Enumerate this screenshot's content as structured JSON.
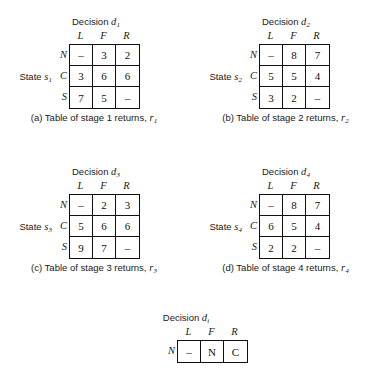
{
  "figure": {
    "kind": "decision-return-tables",
    "background_color": "#ffffff",
    "ink_color": "#111111"
  },
  "tables": [
    {
      "id": "a",
      "decision_prefix": "Decision ",
      "decision_symbol": "d",
      "decision_subscript": "1",
      "state_prefix": "State ",
      "state_symbol": "s",
      "state_subscript": "1",
      "col_headers": [
        "L",
        "F",
        "R"
      ],
      "row_headers": [
        "N",
        "C",
        "S"
      ],
      "rows": [
        [
          "–",
          "3",
          "2"
        ],
        [
          "3",
          "6",
          "6"
        ],
        [
          "7",
          "5",
          "–"
        ]
      ],
      "caption_text": "(a) Table of stage 1 returns, ",
      "caption_symbol": "r",
      "caption_subscript": "1"
    },
    {
      "id": "b",
      "decision_prefix": "Decision ",
      "decision_symbol": "d",
      "decision_subscript": "2",
      "state_prefix": "State ",
      "state_symbol": "s",
      "state_subscript": "2",
      "col_headers": [
        "L",
        "F",
        "R"
      ],
      "row_headers": [
        "N",
        "C",
        "S"
      ],
      "rows": [
        [
          "–",
          "8",
          "7"
        ],
        [
          "5",
          "5",
          "4"
        ],
        [
          "3",
          "2",
          "–"
        ]
      ],
      "caption_text": "(b) Table of stage 2 returns, ",
      "caption_symbol": "r",
      "caption_subscript": "2"
    },
    {
      "id": "c",
      "decision_prefix": "Decision ",
      "decision_symbol": "d",
      "decision_subscript": "3",
      "state_prefix": "State ",
      "state_symbol": "s",
      "state_subscript": "3",
      "col_headers": [
        "L",
        "F",
        "R"
      ],
      "row_headers": [
        "N",
        "C",
        "S"
      ],
      "rows": [
        [
          "–",
          "2",
          "3"
        ],
        [
          "5",
          "6",
          "6"
        ],
        [
          "9",
          "7",
          "–"
        ]
      ],
      "caption_text": "(c) Table of stage 3 returns, ",
      "caption_symbol": "r",
      "caption_subscript": "3"
    },
    {
      "id": "d",
      "decision_prefix": "Decision ",
      "decision_symbol": "d",
      "decision_subscript": "4",
      "state_prefix": "State ",
      "state_symbol": "s",
      "state_subscript": "4",
      "col_headers": [
        "L",
        "F",
        "R"
      ],
      "row_headers": [
        "N",
        "C",
        "S"
      ],
      "rows": [
        [
          "–",
          "8",
          "7"
        ],
        [
          "6",
          "5",
          "4"
        ],
        [
          "2",
          "2",
          "–"
        ]
      ],
      "caption_text": "(d) Table of stage 4 returns, ",
      "caption_symbol": "r",
      "caption_subscript": "4"
    }
  ],
  "partial_table": {
    "id": "i",
    "decision_prefix": "Decision ",
    "decision_symbol": "d",
    "decision_subscript": "i",
    "col_headers": [
      "L",
      "F",
      "R"
    ],
    "row_headers": [
      "N"
    ],
    "rows": [
      [
        "–",
        "N",
        "C"
      ]
    ]
  }
}
